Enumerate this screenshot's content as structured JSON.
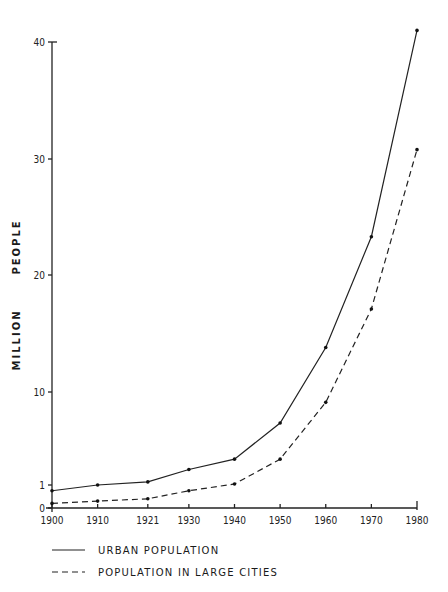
{
  "chart_data": {
    "type": "line",
    "title": "",
    "xlabel": "",
    "ylabel": "MILLION PEOPLE",
    "x": [
      1900,
      1910,
      1921,
      1930,
      1940,
      1950,
      1960,
      1970,
      1980
    ],
    "x_tick_labels": [
      "1900",
      "1910",
      "1921",
      "1930",
      "1940",
      "1950",
      "1960",
      "1970",
      "1980"
    ],
    "y_ticks": [
      0,
      1,
      10,
      20,
      30,
      40
    ],
    "y_tick_labels": [
      "0",
      "1",
      "10",
      "20",
      "30",
      "40"
    ],
    "ylim": [
      0,
      40
    ],
    "grid": false,
    "legend_position": "bottom",
    "series": [
      {
        "name": "URBAN POPULATION",
        "style": "solid",
        "values": [
          0.75,
          1.0,
          1.3,
          2.5,
          3.5,
          7.0,
          13.8,
          23.3,
          41.0
        ]
      },
      {
        "name": "POPULATION IN LARGE CITIES",
        "style": "dashed",
        "values": [
          0.2,
          0.3,
          0.4,
          0.75,
          1.1,
          3.5,
          9.0,
          17.1,
          30.8
        ]
      }
    ]
  },
  "legend": {
    "items": [
      {
        "label": "URBAN POPULATION",
        "style": "solid"
      },
      {
        "label": "POPULATION IN LARGE CITIES",
        "style": "dashed"
      }
    ]
  },
  "axis": {
    "ylabel_word1": "MILLION",
    "ylabel_word2": "PEOPLE"
  },
  "colors": {
    "line": "#222222",
    "background": "#ffffff"
  }
}
